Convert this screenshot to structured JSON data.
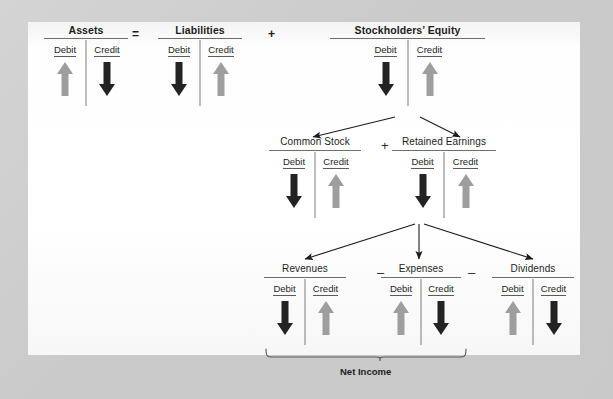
{
  "diagram": {
    "net_income_label": "Net Income",
    "operators": {
      "equals": "=",
      "plus": "+",
      "plus_mid": "+",
      "minus_1": "–",
      "minus_2": "–"
    },
    "column_labels": {
      "debit": "Debit",
      "credit": "Credit"
    },
    "accounts": [
      {
        "name": "Assets",
        "bold": true,
        "debit": {
          "direction": "up",
          "color": "gray"
        },
        "credit": {
          "direction": "down",
          "color": "dark"
        }
      },
      {
        "name": "Liabilities",
        "bold": true,
        "debit": {
          "direction": "down",
          "color": "dark"
        },
        "credit": {
          "direction": "up",
          "color": "gray"
        }
      },
      {
        "name": "Stockholders’ Equity",
        "bold": true,
        "debit": {
          "direction": "down",
          "color": "dark"
        },
        "credit": {
          "direction": "up",
          "color": "gray"
        }
      },
      {
        "name": "Common Stock",
        "bold": false,
        "debit": {
          "direction": "down",
          "color": "dark"
        },
        "credit": {
          "direction": "up",
          "color": "gray"
        }
      },
      {
        "name": "Retained Earnings",
        "bold": false,
        "debit": {
          "direction": "down",
          "color": "dark"
        },
        "credit": {
          "direction": "up",
          "color": "gray"
        }
      },
      {
        "name": "Revenues",
        "bold": false,
        "debit": {
          "direction": "down",
          "color": "dark"
        },
        "credit": {
          "direction": "up",
          "color": "gray"
        }
      },
      {
        "name": "Expenses",
        "bold": false,
        "debit": {
          "direction": "up",
          "color": "gray"
        },
        "credit": {
          "direction": "down",
          "color": "dark"
        }
      },
      {
        "name": "Dividends",
        "bold": false,
        "debit": {
          "direction": "up",
          "color": "gray"
        },
        "credit": {
          "direction": "down",
          "color": "dark"
        }
      }
    ],
    "colors": {
      "increase_arrow": "#9e9e9e",
      "decrease_arrow": "#232323",
      "rule": "#6d6d6d",
      "panel_background": "#ffffff",
      "mat_background": "#cccccc",
      "text": "#1d1d1d"
    }
  }
}
